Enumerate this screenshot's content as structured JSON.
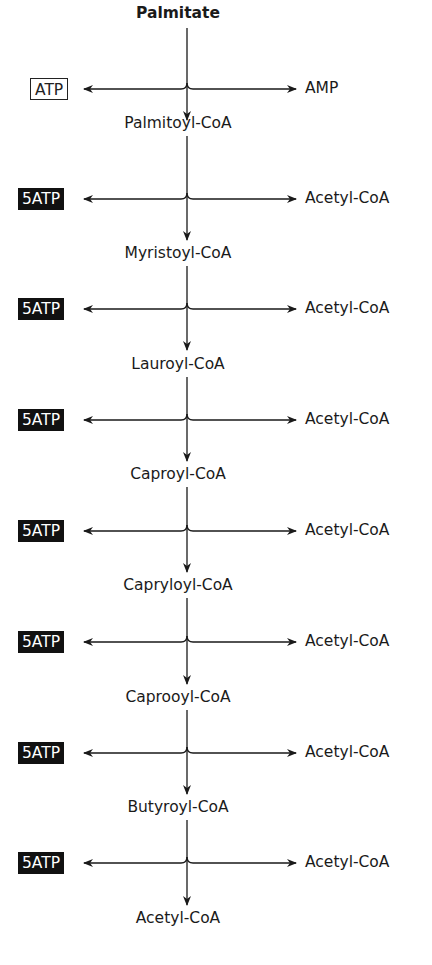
{
  "diagram": {
    "title": "Palmitate",
    "colors": {
      "line": "#1a1a1a",
      "filled_box_bg": "#111111",
      "filled_box_text": "#ffffff"
    },
    "steps": [
      {
        "input": "Palmitate",
        "left_product": "ATP",
        "left_style": "outline",
        "right_product": "AMP",
        "output": "Palmitoyl-CoA"
      },
      {
        "input": "Palmitoyl-CoA",
        "left_product": "5ATP",
        "left_style": "filled",
        "right_product": "Acetyl-CoA",
        "output": "Myristoyl-CoA"
      },
      {
        "input": "Myristoyl-CoA",
        "left_product": "5ATP",
        "left_style": "filled",
        "right_product": "Acetyl-CoA",
        "output": "Lauroyl-CoA"
      },
      {
        "input": "Lauroyl-CoA",
        "left_product": "5ATP",
        "left_style": "filled",
        "right_product": "Acetyl-CoA",
        "output": "Caproyl-CoA"
      },
      {
        "input": "Caproyl-CoA",
        "left_product": "5ATP",
        "left_style": "filled",
        "right_product": "Acetyl-CoA",
        "output": "Capryloyl-CoA"
      },
      {
        "input": "Capryloyl-CoA",
        "left_product": "5ATP",
        "left_style": "filled",
        "right_product": "Acetyl-CoA",
        "output": "Caprooyl-CoA"
      },
      {
        "input": "Caprooyl-CoA",
        "left_product": "5ATP",
        "left_style": "filled",
        "right_product": "Acetyl-CoA",
        "output": "Butyroyl-CoA"
      },
      {
        "input": "Butyroyl-CoA",
        "left_product": "5ATP",
        "left_style": "filled",
        "right_product": "Acetyl-CoA",
        "output": "Acetyl-CoA"
      }
    ],
    "nodes": [
      "Palmitate",
      "Palmitoyl-CoA",
      "Myristoyl-CoA",
      "Lauroyl-CoA",
      "Caproyl-CoA",
      "Capryloyl-CoA",
      "Caprooyl-CoA",
      "Butyroyl-CoA",
      "Acetyl-CoA"
    ],
    "left_products": [
      "ATP",
      "5ATP",
      "5ATP",
      "5ATP",
      "5ATP",
      "5ATP",
      "5ATP",
      "5ATP"
    ],
    "right_products": [
      "AMP",
      "Acetyl-CoA",
      "Acetyl-CoA",
      "Acetyl-CoA",
      "Acetyl-CoA",
      "Acetyl-CoA",
      "Acetyl-CoA",
      "Acetyl-CoA"
    ]
  }
}
